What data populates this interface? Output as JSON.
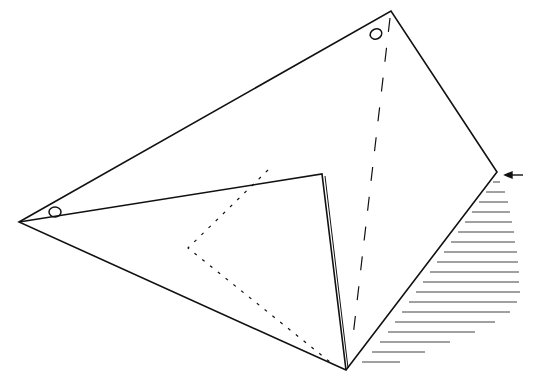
{
  "diagram": {
    "type": "origami-fold-step",
    "colors": {
      "line": "#111111",
      "background": "#ffffff",
      "shade": "#222222"
    },
    "vertices": {
      "top": [
        391,
        11
      ],
      "left": [
        19,
        222
      ],
      "right": [
        497,
        172
      ],
      "bottom": [
        346,
        370
      ],
      "flap_tip": [
        322,
        174
      ]
    },
    "markers": [
      {
        "name": "circle-left",
        "cx": 55,
        "cy": 212
      },
      {
        "name": "circle-top",
        "cx": 376,
        "cy": 34
      }
    ],
    "arrow": {
      "direction": "left",
      "x1": 523,
      "y1": 175,
      "x2": 506,
      "y2": 175
    }
  }
}
